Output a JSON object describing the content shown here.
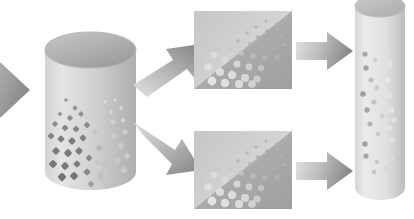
{
  "figure": {
    "background": "#ffffff",
    "width": 414,
    "height": 219
  },
  "palette": {
    "light_gray": "#d8d8d8",
    "mid_gray": "#bdbdbd",
    "dark_gray": "#9a9a9a",
    "deep_gray": "#7e7e7e",
    "panel_light": "#cfcfcf",
    "panel_dark": "#a5a5a5",
    "particle_dark": "#8a8a8a",
    "particle_light": "#e4e4e4",
    "outline": "#b0b0b0"
  },
  "nodes": {
    "inlet_arrow": {
      "name": "Inlet feed arrow",
      "direction": "right",
      "cropped": "left edge",
      "fill_from": "#c9c9c9",
      "fill_to": "#8e8e8e"
    },
    "feed_cylinder": {
      "name": "Feed cylinder",
      "shape": "cylinder",
      "particle_shape": "square",
      "particle_count": 46,
      "body_from": "#e2e2e2",
      "body_to": "#b4b4b4",
      "cap_from": "#bdbdbd",
      "cap_to": "#9e9e9e"
    },
    "branch_arrow_up": {
      "name": "Upper branch arrow",
      "direction": "up-right",
      "fill_from": "#dcdcdc",
      "fill_to": "#8c8c8c"
    },
    "branch_arrow_down": {
      "name": "Lower branch arrow",
      "direction": "down-right",
      "fill_from": "#dcdcdc",
      "fill_to": "#8c8c8c"
    },
    "panel_top": {
      "name": "Upper separation panel",
      "shape": "rectangle split on diagonal",
      "particle_shape": "circle",
      "particle_count": 33,
      "upper_fill": "#d2d2d2",
      "lower_fill": "#a8a8a8"
    },
    "panel_bottom": {
      "name": "Lower separation panel",
      "shape": "rectangle split on diagonal",
      "particle_shape": "circle",
      "particle_count": 33,
      "upper_fill": "#d2d2d2",
      "lower_fill": "#a8a8a8"
    },
    "transfer_arrow_top": {
      "name": "Upper transfer arrow",
      "direction": "right",
      "fill_from": "#dedede",
      "fill_to": "#8a8a8a"
    },
    "transfer_arrow_bottom": {
      "name": "Lower transfer arrow",
      "direction": "right",
      "fill_from": "#dedede",
      "fill_to": "#8a8a8a"
    },
    "product_cylinder": {
      "name": "Product column",
      "shape": "cylinder",
      "cropped": "top edge",
      "particle_shape": "circle",
      "particle_count": 26,
      "body_from": "#e6e6e6",
      "body_to": "#c2c2c2"
    }
  },
  "particles": {
    "feed_squares": [
      {
        "x": 23,
        "y": 72,
        "s": 3.2,
        "c": "#9e9e9e"
      },
      {
        "x": 32,
        "y": 80,
        "s": 4.0,
        "c": "#949494"
      },
      {
        "x": 17,
        "y": 86,
        "s": 3.6,
        "c": "#9a9a9a"
      },
      {
        "x": 27,
        "y": 90,
        "s": 4.6,
        "c": "#8e8e8e"
      },
      {
        "x": 38,
        "y": 86,
        "s": 4.2,
        "c": "#909090"
      },
      {
        "x": 12,
        "y": 96,
        "s": 4.4,
        "c": "#8c8c8c"
      },
      {
        "x": 22,
        "y": 100,
        "s": 5.0,
        "c": "#868686"
      },
      {
        "x": 33,
        "y": 101,
        "s": 5.2,
        "c": "#848484"
      },
      {
        "x": 44,
        "y": 97,
        "s": 4.8,
        "c": "#8a8a8a"
      },
      {
        "x": 8,
        "y": 108,
        "s": 5.2,
        "c": "#828282"
      },
      {
        "x": 18,
        "y": 111,
        "s": 5.6,
        "c": "#7e7e7e"
      },
      {
        "x": 29,
        "y": 113,
        "s": 5.8,
        "c": "#7c7c7c"
      },
      {
        "x": 40,
        "y": 110,
        "s": 5.4,
        "c": "#808080"
      },
      {
        "x": 13,
        "y": 123,
        "s": 6.0,
        "c": "#7a7a7a"
      },
      {
        "x": 25,
        "y": 125,
        "s": 6.2,
        "c": "#787878"
      },
      {
        "x": 36,
        "y": 123,
        "s": 5.8,
        "c": "#7c7c7c"
      },
      {
        "x": 10,
        "y": 136,
        "s": 6.4,
        "c": "#767676"
      },
      {
        "x": 22,
        "y": 138,
        "s": 6.2,
        "c": "#787878"
      },
      {
        "x": 34,
        "y": 136,
        "s": 5.6,
        "c": "#7e7e7e"
      },
      {
        "x": 46,
        "y": 130,
        "s": 5.0,
        "c": "#868686"
      },
      {
        "x": 56,
        "y": 120,
        "s": 5.2,
        "c": "#b8b8b8"
      },
      {
        "x": 52,
        "y": 104,
        "s": 4.2,
        "c": "#c4c4c4"
      },
      {
        "x": 60,
        "y": 92,
        "s": 3.4,
        "c": "#d0d0d0"
      },
      {
        "x": 68,
        "y": 84,
        "s": 3.0,
        "c": "#d8d8d8"
      },
      {
        "x": 62,
        "y": 74,
        "s": 2.6,
        "c": "#dcdcdc"
      },
      {
        "x": 72,
        "y": 72,
        "s": 2.8,
        "c": "#dadada"
      },
      {
        "x": 78,
        "y": 80,
        "s": 3.4,
        "c": "#d6d6d6"
      },
      {
        "x": 70,
        "y": 94,
        "s": 4.2,
        "c": "#d2d2d2"
      },
      {
        "x": 80,
        "y": 92,
        "s": 4.0,
        "c": "#d4d4d4"
      },
      {
        "x": 60,
        "y": 106,
        "s": 4.8,
        "c": "#cccccc"
      },
      {
        "x": 71,
        "y": 108,
        "s": 5.2,
        "c": "#cacaca"
      },
      {
        "x": 82,
        "y": 104,
        "s": 4.6,
        "c": "#d0d0d0"
      },
      {
        "x": 55,
        "y": 134,
        "s": 5.6,
        "c": "#c8c8c8"
      },
      {
        "x": 66,
        "y": 122,
        "s": 6.0,
        "c": "#c6c6c6"
      },
      {
        "x": 78,
        "y": 118,
        "s": 5.4,
        "c": "#cacaca"
      },
      {
        "x": 62,
        "y": 136,
        "s": 6.4,
        "c": "#c4c4c4"
      },
      {
        "x": 74,
        "y": 133,
        "s": 6.2,
        "c": "#c6c6c6"
      },
      {
        "x": 84,
        "y": 128,
        "s": 5.2,
        "c": "#cccccc"
      },
      {
        "x": 58,
        "y": 148,
        "s": 6.6,
        "c": "#c2c2c2"
      },
      {
        "x": 70,
        "y": 147,
        "s": 6.8,
        "c": "#c0c0c0"
      },
      {
        "x": 81,
        "y": 142,
        "s": 6.0,
        "c": "#c6c6c6"
      },
      {
        "x": 44,
        "y": 144,
        "s": 5.6,
        "c": "#8a8a8a"
      },
      {
        "x": 31,
        "y": 148,
        "s": 6.4,
        "c": "#747474"
      },
      {
        "x": 19,
        "y": 149,
        "s": 6.6,
        "c": "#727272"
      },
      {
        "x": 48,
        "y": 156,
        "s": 5.0,
        "c": "#a0a0a0"
      },
      {
        "x": 64,
        "y": 158,
        "s": 6.2,
        "c": "#c4c4c4"
      }
    ],
    "panel_circles": [
      {
        "x": 72,
        "y": 10,
        "r": 1.4,
        "c": "#b4b4b4"
      },
      {
        "x": 82,
        "y": 13,
        "r": 1.5,
        "c": "#b2b2b2"
      },
      {
        "x": 62,
        "y": 16,
        "r": 1.6,
        "c": "#b6b6b6"
      },
      {
        "x": 73,
        "y": 20,
        "r": 1.7,
        "c": "#b0b0b0"
      },
      {
        "x": 84,
        "y": 18,
        "r": 1.6,
        "c": "#b2b2b2"
      },
      {
        "x": 53,
        "y": 22,
        "r": 1.8,
        "c": "#b8b8b8"
      },
      {
        "x": 64,
        "y": 26,
        "r": 1.9,
        "c": "#aeaeae"
      },
      {
        "x": 76,
        "y": 28,
        "r": 1.9,
        "c": "#acacac"
      },
      {
        "x": 87,
        "y": 26,
        "r": 1.8,
        "c": "#b0b0b0"
      },
      {
        "x": 44,
        "y": 30,
        "r": 2.0,
        "c": "#bcbcbc"
      },
      {
        "x": 56,
        "y": 33,
        "r": 2.1,
        "c": "#b4b4b4"
      },
      {
        "x": 68,
        "y": 36,
        "r": 2.2,
        "c": "#aeaeae"
      },
      {
        "x": 80,
        "y": 37,
        "r": 2.1,
        "c": "#acacac"
      },
      {
        "x": 90,
        "y": 34,
        "r": 2.0,
        "c": "#b0b0b0"
      },
      {
        "x": 36,
        "y": 38,
        "r": 2.4,
        "c": "#cacaca"
      },
      {
        "x": 47,
        "y": 42,
        "r": 2.6,
        "c": "#c2c2c2"
      },
      {
        "x": 59,
        "y": 45,
        "r": 2.7,
        "c": "#bababa"
      },
      {
        "x": 71,
        "y": 47,
        "r": 2.6,
        "c": "#b4b4b4"
      },
      {
        "x": 83,
        "y": 46,
        "r": 2.4,
        "c": "#b0b0b0"
      },
      {
        "x": 20,
        "y": 44,
        "r": 3.0,
        "c": "#dcdcdc"
      },
      {
        "x": 31,
        "y": 49,
        "r": 3.3,
        "c": "#dadada"
      },
      {
        "x": 43,
        "y": 53,
        "r": 3.5,
        "c": "#d6d6d6"
      },
      {
        "x": 55,
        "y": 56,
        "r": 3.4,
        "c": "#cececE"
      },
      {
        "x": 67,
        "y": 57,
        "r": 3.1,
        "c": "#c4c4c4"
      },
      {
        "x": 14,
        "y": 56,
        "r": 3.8,
        "c": "#e0e0e0"
      },
      {
        "x": 26,
        "y": 61,
        "r": 4.0,
        "c": "#dedede"
      },
      {
        "x": 38,
        "y": 64,
        "r": 4.2,
        "c": "#dcdcdc"
      },
      {
        "x": 51,
        "y": 67,
        "r": 4.0,
        "c": "#d6d6d6"
      },
      {
        "x": 63,
        "y": 68,
        "r": 3.6,
        "c": "#cccccc"
      },
      {
        "x": 18,
        "y": 70,
        "r": 4.4,
        "c": "#e2e2e2"
      },
      {
        "x": 31,
        "y": 72,
        "r": 4.3,
        "c": "#e0e0e0"
      },
      {
        "x": 45,
        "y": 73,
        "r": 4.1,
        "c": "#dadada"
      },
      {
        "x": 58,
        "y": 73,
        "r": 3.8,
        "c": "#d2d2d2"
      }
    ],
    "product_circles": [
      {
        "x": 12,
        "y": 62,
        "r": 2.6,
        "c": "#a8a8a8"
      },
      {
        "x": 34,
        "y": 58,
        "r": 2.8,
        "c": "#e0e0e0"
      },
      {
        "x": 13,
        "y": 76,
        "r": 2.7,
        "c": "#a4a4a4"
      },
      {
        "x": 37,
        "y": 72,
        "r": 2.9,
        "c": "#e2e2e2"
      },
      {
        "x": 22,
        "y": 68,
        "r": 2.2,
        "c": "#cfcfcf"
      },
      {
        "x": 18,
        "y": 88,
        "r": 2.5,
        "c": "#bcbcbc"
      },
      {
        "x": 35,
        "y": 88,
        "r": 3.0,
        "c": "#e4e4e4"
      },
      {
        "x": 24,
        "y": 96,
        "r": 2.4,
        "c": "#c8c8c8"
      },
      {
        "x": 10,
        "y": 102,
        "r": 2.8,
        "c": "#9e9e9e"
      },
      {
        "x": 36,
        "y": 104,
        "r": 3.0,
        "c": "#e2e2e2"
      },
      {
        "x": 21,
        "y": 110,
        "r": 2.6,
        "c": "#c4c4c4"
      },
      {
        "x": 14,
        "y": 118,
        "r": 2.7,
        "c": "#a6a6a6"
      },
      {
        "x": 38,
        "y": 118,
        "r": 3.1,
        "c": "#e4e4e4"
      },
      {
        "x": 29,
        "y": 124,
        "r": 2.4,
        "c": "#d0d0d0"
      },
      {
        "x": 41,
        "y": 128,
        "r": 2.8,
        "c": "#dedede"
      },
      {
        "x": 17,
        "y": 132,
        "r": 2.5,
        "c": "#b2b2b2"
      },
      {
        "x": 36,
        "y": 136,
        "r": 3.0,
        "c": "#e2e2e2"
      },
      {
        "x": 25,
        "y": 142,
        "r": 2.3,
        "c": "#cccccc"
      },
      {
        "x": 39,
        "y": 148,
        "r": 2.9,
        "c": "#e0e0e0"
      },
      {
        "x": 12,
        "y": 152,
        "r": 2.7,
        "c": "#a2a2a2"
      },
      {
        "x": 35,
        "y": 158,
        "r": 2.8,
        "c": "#dedede"
      },
      {
        "x": 13,
        "y": 164,
        "r": 2.6,
        "c": "#a6a6a6"
      },
      {
        "x": 38,
        "y": 166,
        "r": 2.7,
        "c": "#dcdcdc"
      },
      {
        "x": 24,
        "y": 170,
        "r": 2.2,
        "c": "#cacaca"
      },
      {
        "x": 21,
        "y": 180,
        "r": 2.4,
        "c": "#c6c6c6"
      },
      {
        "x": 33,
        "y": 176,
        "r": 2.5,
        "c": "#d8d8d8"
      }
    ]
  },
  "bleed_text": {
    "left_fragment": "",
    "right_fragment": ""
  }
}
